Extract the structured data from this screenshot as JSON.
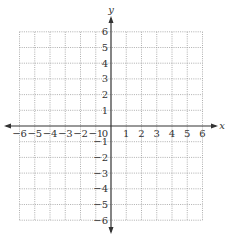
{
  "chart_data": {
    "type": "scatter",
    "title": "",
    "xlabel": "x",
    "ylabel": "y",
    "xlim": [
      -6,
      6
    ],
    "ylim": [
      -6,
      6
    ],
    "grid": true,
    "grid_style": "dotted",
    "x_ticks": [
      -6,
      -5,
      -4,
      -3,
      -2,
      -1,
      1,
      2,
      3,
      4,
      5,
      6
    ],
    "y_ticks": [
      -6,
      -5,
      -4,
      -3,
      -2,
      -1,
      1,
      2,
      3,
      4,
      5,
      6
    ],
    "origin_label": "0",
    "series": []
  },
  "colors": {
    "axis": "#333333",
    "grid": "#9a9a9a",
    "background": "#ffffff"
  }
}
